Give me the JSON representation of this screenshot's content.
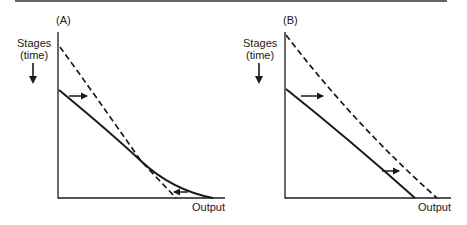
{
  "figure": {
    "panels": [
      {
        "id": "A",
        "label": "(A)",
        "y_axis_label_line1": "Stages",
        "y_axis_label_line2": "(time)",
        "y_axis_direction": "down-arrow",
        "x_axis_label": "Output",
        "curves": [
          {
            "style": "solid",
            "description": "original curve, gentler, intersects dashed curve"
          },
          {
            "style": "dashed",
            "description": "shifted curve, steeper; starts higher on stages axis and ends at lower output"
          }
        ],
        "arrows": [
          {
            "direction": "right",
            "position": "upper-left, between curves"
          },
          {
            "direction": "left",
            "position": "lower-right, near output axis"
          }
        ]
      },
      {
        "id": "B",
        "label": "(B)",
        "y_axis_label_line1": "Stages",
        "y_axis_label_line2": "(time)",
        "y_axis_direction": "down-arrow",
        "x_axis_label": "Output",
        "curves": [
          {
            "style": "solid",
            "description": "original curve"
          },
          {
            "style": "dashed",
            "description": "outward-shifted curve, parallel-ish above solid"
          }
        ],
        "arrows": [
          {
            "direction": "right",
            "position": "upper-left, between curves"
          },
          {
            "direction": "right",
            "position": "lower-right, between curves"
          }
        ]
      }
    ],
    "colors": {
      "line": "#1a1a1a",
      "background": "#ffffff",
      "rule": "#333333"
    }
  }
}
